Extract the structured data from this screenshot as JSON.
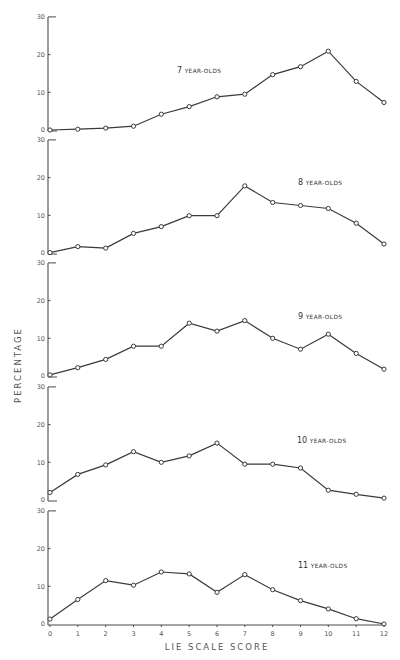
{
  "chart_data": {
    "type": "line",
    "layout": "vertical small multiples (5 panels, shared x-axis)",
    "xlabel": "LIE SCALE SCORE",
    "ylabel": "PERCENTAGE",
    "x": [
      0,
      1,
      2,
      3,
      4,
      5,
      6,
      7,
      8,
      9,
      10,
      11,
      12
    ],
    "x_tick_labels": [
      "0",
      "1",
      "2",
      "3",
      "4",
      "5",
      "6",
      "7",
      "8",
      "9",
      "10",
      "11",
      "12"
    ],
    "xlim": [
      0,
      12
    ],
    "ylim": [
      0,
      30
    ],
    "y_tick_labels": [
      "0",
      "10",
      "20",
      "30"
    ],
    "y_ticks": [
      0,
      10,
      20,
      30
    ],
    "grid": false,
    "legend": "none (each panel labelled in its upper-right area)",
    "panels": [
      {
        "title_number": "7",
        "title_rest": "YEAR-OLDS",
        "values": [
          0,
          0.2,
          0.5,
          1.0,
          4.2,
          6.2,
          8.8,
          9.5,
          14.7,
          16.8,
          20.9,
          12.9,
          7.3
        ]
      },
      {
        "title_number": "8",
        "title_rest": "YEAR-OLDS",
        "values": [
          0.1,
          1.7,
          1.3,
          5.2,
          7.0,
          9.9,
          9.9,
          17.8,
          13.4,
          12.6,
          11.8,
          7.9,
          2.4
        ]
      },
      {
        "title_number": "9",
        "title_rest": "YEAR-OLDS",
        "values": [
          0.3,
          2.2,
          4.4,
          7.9,
          7.9,
          14.0,
          11.9,
          14.7,
          10.0,
          7.1,
          11.1,
          6.0,
          1.8
        ]
      },
      {
        "title_number": "10",
        "title_rest": "YEAR-OLDS",
        "values": [
          2.0,
          6.8,
          9.3,
          12.8,
          10.0,
          11.7,
          15.1,
          9.5,
          9.5,
          8.5,
          2.6,
          1.5,
          0.5
        ]
      },
      {
        "title_number": "11",
        "title_rest": "YEAR-OLDS",
        "values": [
          1.3,
          6.5,
          11.5,
          10.3,
          13.8,
          13.3,
          8.4,
          13.1,
          9.1,
          6.2,
          4.0,
          1.4,
          0
        ]
      }
    ]
  },
  "colors": {
    "line": "#3a3a3a",
    "axis": "#4a4a4a",
    "text": "#555555",
    "background": "#ffffff"
  }
}
